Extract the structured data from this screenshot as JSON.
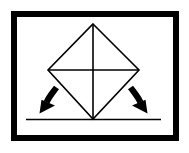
{
  "figure": {
    "title": "Square balanced on a vertex with rotation arrows",
    "caption": "",
    "background_color": "#FFFFFF",
    "ink_color": "#000000"
  },
  "frame": {
    "label": "Figure border frame",
    "stroke_color": "#000000",
    "fill_color": "#FFFFFF",
    "x": 14,
    "y": 14,
    "width": 162,
    "height": 124,
    "stroke_width": 6
  },
  "shape": {
    "label": "Square rotated 45 degrees resting on its lower vertex",
    "name": "diamond",
    "stroke_color": "#000000",
    "stroke_width": 1.6,
    "fill": "none",
    "vertices": {
      "top": {
        "x": 93,
        "y": 24
      },
      "left": {
        "x": 48,
        "y": 70
      },
      "right": {
        "x": 139,
        "y": 70
      },
      "bottom": {
        "x": 93,
        "y": 119
      }
    },
    "diagonals": [
      {
        "name": "vertical-diagonal",
        "x1": 93,
        "y1": 24,
        "x2": 93,
        "y2": 119
      },
      {
        "name": "horizontal-diagonal",
        "x1": 48,
        "y1": 70,
        "x2": 139,
        "y2": 70
      }
    ]
  },
  "ground_line": {
    "label": "Ground surface line",
    "stroke_color": "#000000",
    "stroke_width": 1.6,
    "x1": 26,
    "y1": 119.5,
    "x2": 161,
    "y2": 119.5
  },
  "arrows": [
    {
      "id": "arrow-left",
      "label": "Tip-to-the-left rotation arrow",
      "direction": "down-left",
      "color": "#000000",
      "shaft_width": 5.5,
      "start": {
        "x": 53,
        "y": 89
      },
      "end": {
        "x": 44,
        "y": 111
      }
    },
    {
      "id": "arrow-right",
      "label": "Tip-to-the-right rotation arrow",
      "direction": "down-right",
      "color": "#000000",
      "shaft_width": 5.5,
      "start": {
        "x": 134,
        "y": 89
      },
      "end": {
        "x": 143,
        "y": 111
      }
    }
  ]
}
